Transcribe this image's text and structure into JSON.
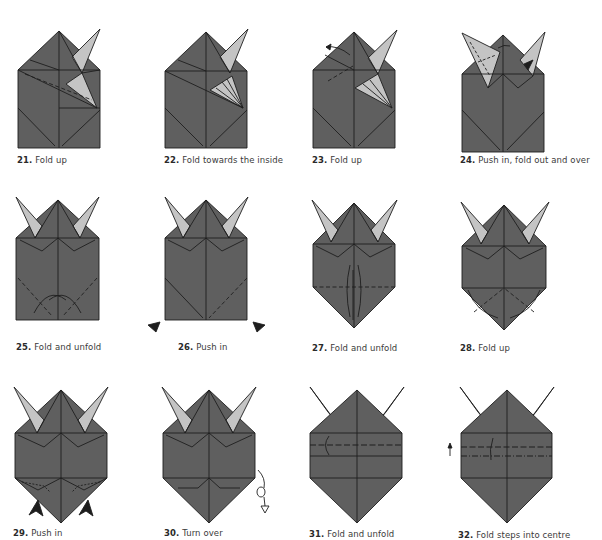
{
  "colors": {
    "paper_dark": "#5f5f5f",
    "paper_light": "#c4c4c4",
    "line": "#1e1e1e",
    "background": "#ffffff",
    "text": "#3a3a3a"
  },
  "steps": [
    {
      "number": "21.",
      "label": "Fold up"
    },
    {
      "number": "22.",
      "label": "Fold towards the inside"
    },
    {
      "number": "23.",
      "label": "Fold up"
    },
    {
      "number": "24.",
      "label": "Push in, fold out and over"
    },
    {
      "number": "25.",
      "label": "Fold and unfold"
    },
    {
      "number": "26.",
      "label": "Push in"
    },
    {
      "number": "27.",
      "label": "Fold and unfold"
    },
    {
      "number": "28.",
      "label": "Fold up"
    },
    {
      "number": "29.",
      "label": "Push in"
    },
    {
      "number": "30.",
      "label": "Turn over"
    },
    {
      "number": "31.",
      "label": "Fold and unfold"
    },
    {
      "number": "32.",
      "label": "Fold steps into centre"
    }
  ]
}
